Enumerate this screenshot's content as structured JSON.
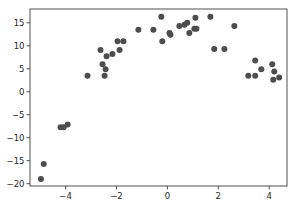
{
  "chart_data": {
    "type": "scatter",
    "title": "",
    "xlabel": "",
    "ylabel": "",
    "xlim": [
      -5.4,
      4.7
    ],
    "ylim": [
      -20.5,
      18.0
    ],
    "grid": false,
    "legend": null,
    "marker_color": "#4d4d4d",
    "xticks": [
      -4,
      -2,
      0,
      2,
      4
    ],
    "xtick_labels": [
      "−4",
      "−2",
      "0",
      "2",
      "4"
    ],
    "yticks": [
      -20,
      -15,
      -10,
      -5,
      0,
      5,
      10,
      15
    ],
    "ytick_labels": [
      "−20",
      "−15",
      "−10",
      "−5",
      "0",
      "5",
      "10",
      "15"
    ],
    "points": [
      {
        "x": -4.97,
        "y": -19.0
      },
      {
        "x": -4.86,
        "y": -15.7
      },
      {
        "x": -4.2,
        "y": -7.7
      },
      {
        "x": -4.08,
        "y": -7.7
      },
      {
        "x": -3.92,
        "y": -7.1
      },
      {
        "x": -3.14,
        "y": 3.5
      },
      {
        "x": -2.63,
        "y": 9.1
      },
      {
        "x": -2.55,
        "y": 6.0
      },
      {
        "x": -2.47,
        "y": 3.5
      },
      {
        "x": -2.43,
        "y": 4.9
      },
      {
        "x": -2.39,
        "y": 7.7
      },
      {
        "x": -2.16,
        "y": 8.2
      },
      {
        "x": -1.96,
        "y": 11.0
      },
      {
        "x": -1.88,
        "y": 9.1
      },
      {
        "x": -1.73,
        "y": 11.0
      },
      {
        "x": -1.14,
        "y": 13.5
      },
      {
        "x": -0.55,
        "y": 13.5
      },
      {
        "x": -0.24,
        "y": 16.3
      },
      {
        "x": -0.2,
        "y": 11.0
      },
      {
        "x": 0.08,
        "y": 12.8
      },
      {
        "x": 0.12,
        "y": 12.4
      },
      {
        "x": 0.47,
        "y": 14.3
      },
      {
        "x": 0.67,
        "y": 14.6
      },
      {
        "x": 0.78,
        "y": 15.0
      },
      {
        "x": 0.86,
        "y": 12.8
      },
      {
        "x": 1.06,
        "y": 13.7
      },
      {
        "x": 1.1,
        "y": 16.1
      },
      {
        "x": 1.14,
        "y": 13.7
      },
      {
        "x": 1.69,
        "y": 16.3
      },
      {
        "x": 1.84,
        "y": 9.3
      },
      {
        "x": 2.24,
        "y": 9.3
      },
      {
        "x": 2.63,
        "y": 14.3
      },
      {
        "x": 3.18,
        "y": 3.5
      },
      {
        "x": 3.45,
        "y": 6.8
      },
      {
        "x": 3.45,
        "y": 3.5
      },
      {
        "x": 3.69,
        "y": 4.9
      },
      {
        "x": 4.12,
        "y": 6.0
      },
      {
        "x": 4.16,
        "y": 2.6
      },
      {
        "x": 4.2,
        "y": 4.4
      },
      {
        "x": 4.39,
        "y": 3.1
      }
    ]
  }
}
